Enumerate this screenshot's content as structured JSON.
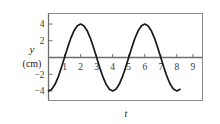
{
  "figure": {
    "name": "oscillation-graph",
    "frame_color": "#8a8a8a",
    "axis_color": "#6e6e6e",
    "curve_color": "#1a1a1a",
    "tick_label_color": "#3a3a3a"
  },
  "axes": {
    "y_axis_label_symbol": "y",
    "y_axis_label_unit": "(cm)",
    "x_axis_label_symbol": "t"
  },
  "chart_data": {
    "type": "line",
    "title": "",
    "xlabel": "t",
    "ylabel": "y (cm)",
    "xlim": [
      0,
      9.6
    ],
    "ylim": [
      -5.2,
      5.2
    ],
    "grid": false,
    "legend": null,
    "x_ticks": [
      1,
      2,
      3,
      4,
      5,
      6,
      7,
      8,
      9
    ],
    "x_tick_labels": [
      "1",
      "2",
      "3",
      "4",
      "5",
      "6",
      "7",
      "8",
      "9"
    ],
    "y_ticks": [
      4,
      2,
      -2,
      -4
    ],
    "y_tick_labels": [
      "4",
      "2",
      "-2",
      "-4"
    ],
    "series": [
      {
        "name": "y(t)",
        "equation": "y = -4 cos(pi t / 2)",
        "amplitude": 4,
        "period": 4,
        "x_start": 0,
        "x_end": 8.2,
        "x": [
          0,
          0.2,
          0.4,
          0.6,
          0.8,
          1,
          1.2,
          1.4,
          1.6,
          1.8,
          2,
          2.2,
          2.4,
          2.6,
          2.8,
          3,
          3.2,
          3.4,
          3.6,
          3.8,
          4,
          4.2,
          4.4,
          4.6,
          4.8,
          5,
          5.2,
          5.4,
          5.6,
          5.8,
          6,
          6.2,
          6.4,
          6.6,
          6.8,
          7,
          7.2,
          7.4,
          7.6,
          7.8,
          8,
          8.2
        ],
        "y": [
          -4,
          -3.8,
          -3.24,
          -2.35,
          -1.24,
          0,
          1.24,
          2.35,
          3.24,
          3.8,
          4,
          3.8,
          3.24,
          2.35,
          1.24,
          0,
          -1.24,
          -2.35,
          -3.24,
          -3.8,
          -4,
          -3.8,
          -3.24,
          -2.35,
          -1.24,
          0,
          1.24,
          2.35,
          3.24,
          3.8,
          4,
          3.8,
          3.24,
          2.35,
          1.24,
          0,
          -1.24,
          -2.35,
          -3.24,
          -3.8,
          -4,
          -3.8
        ]
      }
    ]
  }
}
